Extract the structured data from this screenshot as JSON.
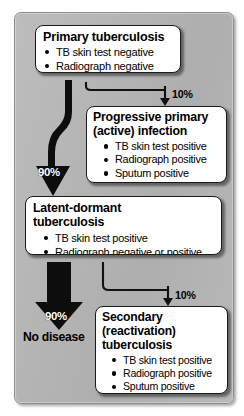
{
  "diagram": {
    "background_color": "#b4b4b4",
    "box_fill": "#ffffff",
    "arrow_color": "#000000"
  },
  "nodes": {
    "primary": {
      "heading": "Primary tuberculosis",
      "findings": [
        "TB skin test negative",
        "Radiograph negative"
      ]
    },
    "progressive": {
      "heading_line1": "Progressive primary",
      "heading_line2": "(active) infection",
      "findings": [
        "TB skin test positive",
        "Radiograph positive",
        "Sputum positive"
      ]
    },
    "latent": {
      "heading_line1": "Latent-dormant",
      "heading_line2": "tuberculosis",
      "findings": [
        "TB skin test positive",
        "Radiograph negative or positive"
      ]
    },
    "secondary": {
      "heading_line1": "Secondary",
      "heading_line2": "(reactivation)",
      "heading_line3": "tuberculosis",
      "findings": [
        "TB skin test positive",
        "Radiograph positive",
        "Sputum positive"
      ]
    },
    "no_disease": {
      "label": "No disease"
    }
  },
  "edges": {
    "primary_to_progressive": {
      "label": "10%",
      "style": "thin-elbow"
    },
    "primary_to_latent": {
      "label": "90%",
      "style": "thick-s-curve"
    },
    "latent_to_secondary": {
      "label": "10%",
      "style": "thin-elbow"
    },
    "latent_to_no_disease": {
      "label": "90%",
      "style": "thick-straight"
    }
  }
}
